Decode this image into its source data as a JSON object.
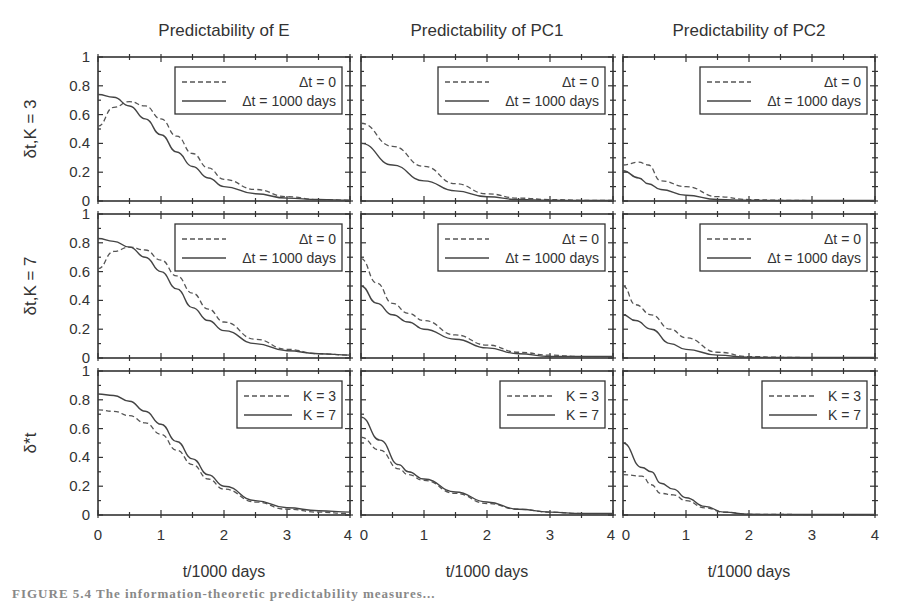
{
  "figure": {
    "caption_visible": "FIGURE 5.4  The information-theoretic predictability measures..."
  },
  "chart_data": [
    {
      "type": "line",
      "panel": "row1-col1",
      "title": "Predictability of E",
      "xlabel": "",
      "ylabel": "δt, K = 3",
      "xlim": [
        0,
        4
      ],
      "ylim": [
        0,
        1
      ],
      "x": [
        0,
        0.25,
        0.5,
        0.75,
        1.0,
        1.25,
        1.5,
        1.75,
        2.0,
        2.5,
        3.0,
        3.5,
        4.0
      ],
      "series": [
        {
          "name": "Δt = 0",
          "style": "dashed",
          "values": [
            0.52,
            0.65,
            0.69,
            0.66,
            0.57,
            0.45,
            0.33,
            0.23,
            0.15,
            0.08,
            0.03,
            0.01,
            0.005
          ]
        },
        {
          "name": "Δt = 1000 days",
          "style": "solid",
          "values": [
            0.74,
            0.72,
            0.66,
            0.57,
            0.46,
            0.34,
            0.24,
            0.16,
            0.1,
            0.05,
            0.02,
            0.01,
            0.005
          ]
        }
      ],
      "legend": [
        "Δt = 0",
        "Δt = 1000 days"
      ],
      "legend_position": "upper right"
    },
    {
      "type": "line",
      "panel": "row1-col2",
      "title": "Predictability of PC1",
      "xlim": [
        0,
        4
      ],
      "ylim": [
        0,
        1
      ],
      "x": [
        0,
        0.5,
        1.0,
        1.5,
        2.0,
        2.5,
        3.0,
        3.5,
        4.0
      ],
      "series": [
        {
          "name": "Δt = 0",
          "style": "dashed",
          "values": [
            0.54,
            0.38,
            0.24,
            0.12,
            0.05,
            0.02,
            0.01,
            0.005,
            0.005
          ]
        },
        {
          "name": "Δt = 1000 days",
          "style": "solid",
          "values": [
            0.4,
            0.25,
            0.14,
            0.07,
            0.03,
            0.01,
            0.005,
            0.003,
            0.003
          ]
        }
      ],
      "legend": [
        "Δt = 0",
        "Δt = 1000 days"
      ],
      "legend_position": "upper right"
    },
    {
      "type": "line",
      "panel": "row1-col3",
      "title": "Predictability of PC2",
      "xlim": [
        0,
        4
      ],
      "ylim": [
        0,
        1
      ],
      "x": [
        0,
        0.25,
        0.4,
        0.6,
        1.0,
        1.5,
        2.0,
        2.5,
        3.0,
        4.0
      ],
      "series": [
        {
          "name": "Δt = 0",
          "style": "dashed",
          "values": [
            0.25,
            0.27,
            0.25,
            0.14,
            0.1,
            0.03,
            0.01,
            0.005,
            0.003,
            0.003
          ]
        },
        {
          "name": "Δt = 1000 days",
          "style": "solid",
          "values": [
            0.21,
            0.16,
            0.12,
            0.08,
            0.04,
            0.01,
            0.005,
            0.003,
            0.003,
            0.003
          ]
        }
      ],
      "legend": [
        "Δt = 0",
        "Δt = 1000 days"
      ],
      "legend_position": "upper right"
    },
    {
      "type": "line",
      "panel": "row2-col1",
      "ylabel": "δt, K = 7",
      "xlim": [
        0,
        4
      ],
      "ylim": [
        0,
        1
      ],
      "x": [
        0,
        0.25,
        0.5,
        0.75,
        1.0,
        1.25,
        1.5,
        1.75,
        2.0,
        2.5,
        3.0,
        3.5,
        4.0
      ],
      "series": [
        {
          "name": "Δt = 0",
          "style": "dashed",
          "values": [
            0.62,
            0.74,
            0.77,
            0.75,
            0.68,
            0.57,
            0.45,
            0.34,
            0.25,
            0.13,
            0.06,
            0.03,
            0.02
          ]
        },
        {
          "name": "Δt = 1000 days",
          "style": "solid",
          "values": [
            0.83,
            0.81,
            0.77,
            0.7,
            0.6,
            0.48,
            0.35,
            0.26,
            0.19,
            0.1,
            0.05,
            0.03,
            0.02
          ]
        }
      ],
      "legend": [
        "Δt = 0",
        "Δt = 1000 days"
      ],
      "legend_position": "upper right"
    },
    {
      "type": "line",
      "panel": "row2-col2",
      "xlim": [
        0,
        4
      ],
      "ylim": [
        0,
        1
      ],
      "x": [
        0,
        0.25,
        0.5,
        0.75,
        1.0,
        1.5,
        2.0,
        2.5,
        3.0,
        3.5,
        4.0
      ],
      "series": [
        {
          "name": "Δt = 0",
          "style": "dashed",
          "values": [
            0.69,
            0.52,
            0.38,
            0.31,
            0.26,
            0.16,
            0.09,
            0.04,
            0.02,
            0.01,
            0.01
          ]
        },
        {
          "name": "Δt = 1000 days",
          "style": "solid",
          "values": [
            0.5,
            0.38,
            0.3,
            0.25,
            0.2,
            0.13,
            0.07,
            0.03,
            0.01,
            0.01,
            0.01
          ]
        }
      ],
      "legend": [
        "Δt = 0",
        "Δt = 1000 days"
      ],
      "legend_position": "upper right"
    },
    {
      "type": "line",
      "panel": "row2-col3",
      "xlim": [
        0,
        4
      ],
      "ylim": [
        0,
        1
      ],
      "x": [
        0,
        0.2,
        0.45,
        0.75,
        1.0,
        1.5,
        2.0,
        2.5,
        3.0,
        4.0
      ],
      "series": [
        {
          "name": "Δt = 0",
          "style": "dashed",
          "values": [
            0.5,
            0.37,
            0.3,
            0.2,
            0.14,
            0.04,
            0.01,
            0.005,
            0.003,
            0.003
          ]
        },
        {
          "name": "Δt = 1000 days",
          "style": "solid",
          "values": [
            0.3,
            0.26,
            0.2,
            0.1,
            0.06,
            0.02,
            0.005,
            0.003,
            0.003,
            0.003
          ]
        }
      ],
      "legend": [
        "Δt = 0",
        "Δt = 1000 days"
      ],
      "legend_position": "upper right"
    },
    {
      "type": "line",
      "panel": "row3-col1",
      "ylabel": "δ*t",
      "xlabel": "t/1000 days",
      "xlim": [
        0,
        4
      ],
      "ylim": [
        0,
        1
      ],
      "xticks": [
        0,
        1,
        2,
        3,
        4
      ],
      "x": [
        0,
        0.25,
        0.5,
        0.75,
        1.0,
        1.25,
        1.5,
        1.75,
        2.0,
        2.5,
        3.0,
        3.5,
        4.0
      ],
      "series": [
        {
          "name": "K = 3",
          "style": "dashed",
          "values": [
            0.73,
            0.72,
            0.69,
            0.64,
            0.56,
            0.45,
            0.35,
            0.25,
            0.18,
            0.09,
            0.04,
            0.02,
            0.01
          ]
        },
        {
          "name": "K = 7",
          "style": "solid",
          "values": [
            0.84,
            0.83,
            0.79,
            0.72,
            0.63,
            0.51,
            0.39,
            0.28,
            0.2,
            0.1,
            0.05,
            0.03,
            0.02
          ]
        }
      ],
      "legend": [
        "K = 3",
        "K = 7"
      ],
      "legend_position": "upper right"
    },
    {
      "type": "line",
      "panel": "row3-col2",
      "xlabel": "t/1000 days",
      "xlim": [
        0,
        4
      ],
      "ylim": [
        0,
        1
      ],
      "xticks": [
        0,
        1,
        2,
        3,
        4
      ],
      "x": [
        0,
        0.3,
        0.6,
        0.75,
        1.0,
        1.5,
        2.0,
        2.5,
        3.0,
        3.5,
        4.0
      ],
      "series": [
        {
          "name": "K = 3",
          "style": "dashed",
          "values": [
            0.54,
            0.45,
            0.32,
            0.28,
            0.24,
            0.15,
            0.08,
            0.04,
            0.02,
            0.01,
            0.01
          ]
        },
        {
          "name": "K = 7",
          "style": "solid",
          "values": [
            0.68,
            0.52,
            0.35,
            0.3,
            0.25,
            0.16,
            0.09,
            0.04,
            0.02,
            0.01,
            0.01
          ]
        }
      ],
      "legend": [
        "K = 3",
        "K = 7"
      ],
      "legend_position": "upper right"
    },
    {
      "type": "line",
      "panel": "row3-col3",
      "xlabel": "t/1000 days",
      "xlim": [
        0,
        4
      ],
      "ylim": [
        0,
        1
      ],
      "xticks": [
        0,
        1,
        2,
        3,
        4
      ],
      "x": [
        0,
        0.3,
        0.45,
        0.6,
        0.8,
        1.0,
        1.3,
        1.6,
        2.0,
        3.0,
        4.0
      ],
      "series": [
        {
          "name": "K = 3",
          "style": "dashed",
          "values": [
            0.28,
            0.27,
            0.21,
            0.15,
            0.14,
            0.1,
            0.05,
            0.02,
            0.005,
            0.003,
            0.003
          ]
        },
        {
          "name": "K = 7",
          "style": "solid",
          "values": [
            0.5,
            0.33,
            0.3,
            0.22,
            0.18,
            0.12,
            0.06,
            0.02,
            0.005,
            0.003,
            0.003
          ]
        }
      ],
      "legend": [
        "K = 3",
        "K = 7"
      ],
      "legend_position": "upper right"
    }
  ],
  "labels": {
    "col_titles": [
      "Predictability of E",
      "Predictability of PC1",
      "Predictability of PC2"
    ],
    "row_ylabels": [
      "δt,K = 3",
      "δt,K = 7",
      "δ*t"
    ],
    "xlabel": "t/1000 days",
    "yticks": [
      "0",
      "0.2",
      "0.4",
      "0.6",
      "0.8",
      "1"
    ],
    "xticks": [
      "0",
      "1",
      "2",
      "3",
      "4"
    ],
    "legend_dt": [
      "Δt = 0",
      "Δt = 1000 days"
    ],
    "legend_k": [
      "K = 3",
      "K = 7"
    ]
  }
}
